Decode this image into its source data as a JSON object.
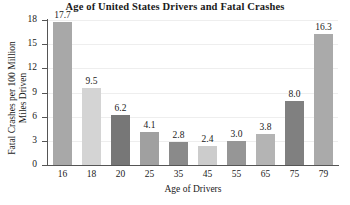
{
  "chart_data": {
    "type": "bar",
    "title": "Age of United States Drivers and Fatal Crashes",
    "xlabel": "Age of Drivers",
    "ylabel_lines": [
      "Fatal Crashes per 100 Million",
      "Miles Driven"
    ],
    "categories": [
      "16",
      "18",
      "20",
      "25",
      "35",
      "45",
      "55",
      "65",
      "75",
      "79"
    ],
    "values": [
      17.7,
      9.5,
      6.2,
      4.1,
      2.8,
      2.4,
      3.0,
      3.8,
      8.0,
      16.3
    ],
    "value_labels": [
      "17.7",
      "9.5",
      "6.2",
      "4.1",
      "2.8",
      "2.4",
      "3.0",
      "3.8",
      "8.0",
      "16.3"
    ],
    "bar_colors": [
      "#a8a8a8",
      "#d4d4d4",
      "#777777",
      "#a0a0a0",
      "#8a8a8a",
      "#cccccc",
      "#969696",
      "#b4b4b4",
      "#808080",
      "#aaaaaa"
    ],
    "ylim": [
      0,
      18
    ],
    "yticks": [
      0,
      3,
      6,
      9,
      12,
      15,
      18
    ],
    "ytick_labels": [
      "0",
      "3",
      "6",
      "9",
      "12",
      "15",
      "18"
    ],
    "grid": true,
    "legend": "none"
  }
}
